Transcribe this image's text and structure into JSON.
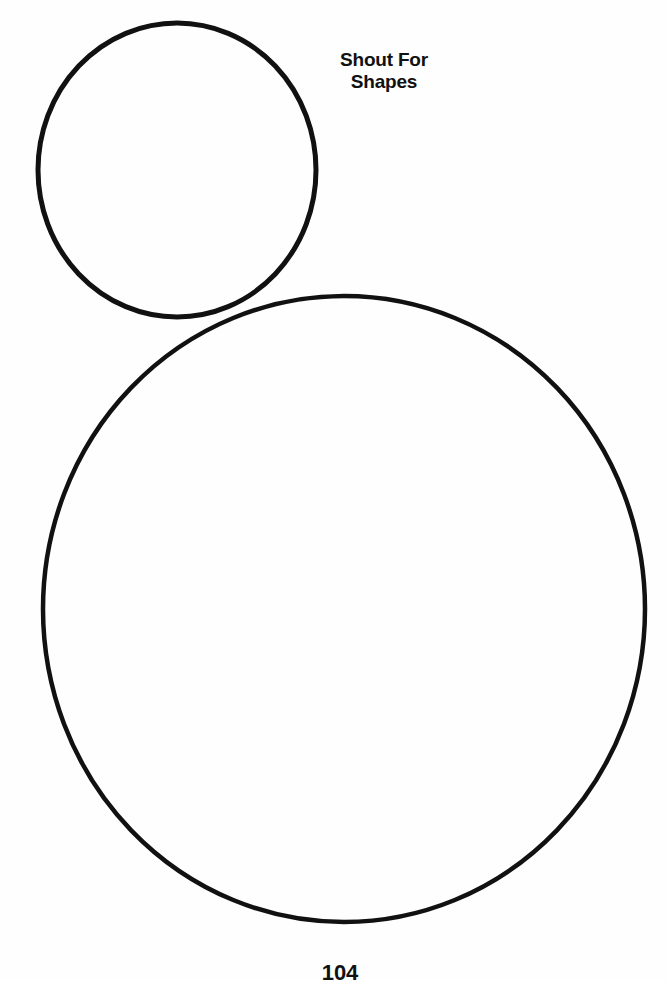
{
  "worksheet": {
    "title_line1": "Shout For",
    "title_line2": "Shapes",
    "page_number": "104"
  },
  "shapes": [
    {
      "type": "circle",
      "label": "small-circle",
      "cx": 177,
      "cy": 170,
      "rx": 141,
      "ry": 148
    },
    {
      "type": "circle",
      "label": "large-circle",
      "cx": 344,
      "cy": 609,
      "rx": 302,
      "ry": 314
    }
  ],
  "colors": {
    "stroke": "#111111",
    "background": "#ffffff"
  }
}
